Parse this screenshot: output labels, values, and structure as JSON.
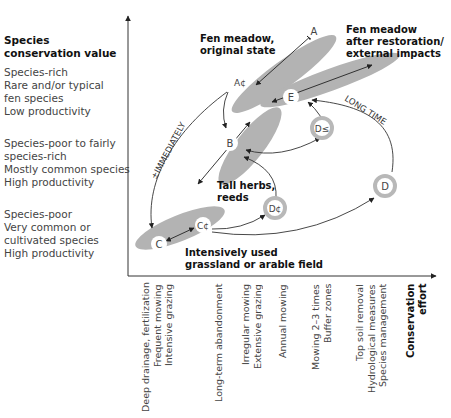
{
  "y_axis": {
    "title": [
      "Species",
      "conservation value"
    ],
    "levels": [
      {
        "lines": [
          "Species-rich",
          "Rare and/or typical",
          "fen species",
          "Low productivity"
        ]
      },
      {
        "lines": [
          "Species-poor to fairly",
          "species-rich",
          "Mostly common species",
          "High productivity"
        ]
      },
      {
        "lines": [
          "Species-poor",
          "Very common or",
          "cultivated species",
          "High productivity"
        ]
      }
    ]
  },
  "x_axis": {
    "title": [
      "Conservation",
      "effort"
    ],
    "categories": [
      {
        "lines": [
          "Deep drainage, fertilization",
          "Frequent mowing",
          "Intensive grazing"
        ]
      },
      {
        "lines": [
          "Long-term abandonment"
        ]
      },
      {
        "lines": [
          "Irregular mowing",
          "Extensive grazing"
        ]
      },
      {
        "lines": [
          "Annual mowing"
        ]
      },
      {
        "lines": [
          "Mowing 2–3 times",
          "Buffer zones"
        ]
      },
      {
        "lines": [
          "Top soil removal",
          "Hydrological measures",
          "Species management"
        ]
      }
    ]
  },
  "nodes": {
    "A": "A",
    "A1": "A¢",
    "B": "B",
    "C": "C",
    "C1": "C¢",
    "D": "D",
    "D1": "D¢",
    "D2": "D≤",
    "E": "E"
  },
  "region_labels": {
    "fen_original": [
      "Fen meadow,",
      "original state"
    ],
    "fen_restored": [
      "Fen meadow",
      "after restoration/",
      "external impacts"
    ],
    "tall_herbs": [
      "Tall herbs,",
      "reeds"
    ],
    "intensive": [
      "Intensively used",
      "grassland or arable field"
    ]
  },
  "curve_labels": {
    "immediately": "±IMMEDIATELY",
    "long_time": "LONG TIME"
  },
  "colors": {
    "ellipse_fill": "#b3b3b3",
    "ring": "#b8b8b8",
    "line": "#333333"
  }
}
